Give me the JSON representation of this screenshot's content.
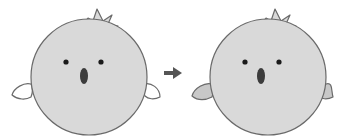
{
  "illustration": {
    "description": "Before/after comparison of a round bird character: wings change from white (left) to gray (right)",
    "colors": {
      "background": "#ffffff",
      "body_fill": "#d9d9d9",
      "outline": "#6a6a6a",
      "eye": "#1a1a1a",
      "mouth": "#3c3c3c",
      "arrow": "#555555"
    },
    "before": {
      "label": "before-bird",
      "wing_fill": "#ffffff"
    },
    "after": {
      "label": "after-bird",
      "wing_fill": "#c8c8c8"
    },
    "arrow": {
      "icon": "right-arrow-icon",
      "direction": "right"
    }
  }
}
